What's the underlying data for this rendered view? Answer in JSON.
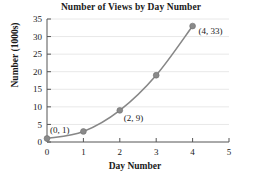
{
  "chart_data": {
    "type": "line",
    "title": "Number of Views by Day Number",
    "xlabel": "Day Number",
    "ylabel": "Number (1000s)",
    "x": [
      0,
      1,
      2,
      3,
      4
    ],
    "values": [
      1,
      3,
      9,
      19,
      33
    ],
    "series": [
      {
        "name": "Views",
        "x": [
          0,
          1,
          2,
          3,
          4
        ],
        "values": [
          1,
          3,
          9,
          19,
          33
        ]
      }
    ],
    "point_labels": [
      "(0, 1)",
      "(2, 9)",
      "(4, 33)"
    ],
    "xlim": [
      0,
      5
    ],
    "ylim": [
      0,
      35
    ],
    "xticks": [
      "0",
      "1",
      "2",
      "3",
      "4",
      "5"
    ],
    "yticks": [
      "0",
      "5",
      "10",
      "15",
      "20",
      "25",
      "30",
      "35"
    ],
    "grid": "horizontal",
    "legend": "none",
    "line_color": "#878787",
    "marker_color": "#8a8a8a",
    "grid_color": "#e8e8e8",
    "axis_color": "#555555"
  },
  "annotations": {
    "p0": "(0, 1)",
    "p2": "(2, 9)",
    "p4": "(4, 33)"
  }
}
